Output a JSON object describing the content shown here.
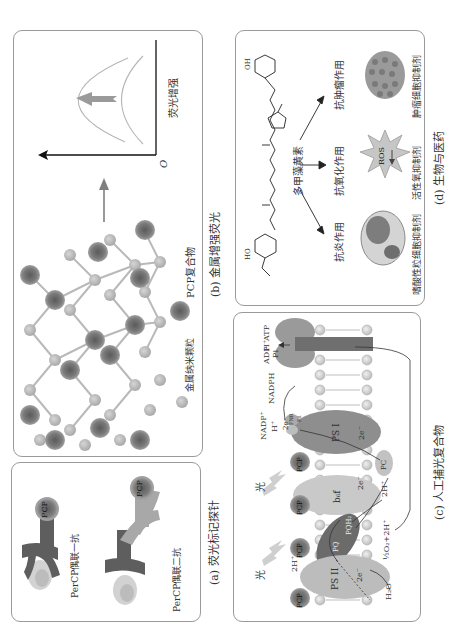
{
  "figure": {
    "panels": {
      "a": {
        "caption": "(a) 荧光标记探针",
        "labels": {
          "primary": "PerCP偶联一抗",
          "secondary": "PerCP偶联二抗",
          "pcp1": "PCP",
          "pcp2": "PCP"
        }
      },
      "b": {
        "caption": "(b) 金属增强荧光",
        "legend": {
          "pcp_complex": "PCP复合物",
          "metal_nanoparticle": "金属纳米颗粒"
        },
        "plot": {
          "ylabel": "荧光增强",
          "origin": "O"
        }
      },
      "c": {
        "caption": "(c) 人工捕光复合物",
        "labels": {
          "light1": "光",
          "light2": "光",
          "pcp": [
            "PCP",
            "PCP",
            "PCP",
            "PCP"
          ],
          "ps2": "PS II",
          "ps1": "PS I",
          "b6f": "b₆f",
          "pq": "PQ",
          "pqh2": "PQH₂",
          "pc": "PC",
          "fnr": "FNR",
          "fd": "Fd",
          "h2o": "H₂O",
          "o2": "½O₂+2H⁺",
          "2h_top": "2H⁺",
          "2h_bottom": "2H⁺",
          "2e_ps2": "2e⁻",
          "2e_b6f": "2e⁻",
          "2e_ps1": "2e⁻",
          "2e_fd": "2e⁻",
          "nadp": "NADP⁺",
          "h_nadp": "H⁺",
          "nadph": "NADPH",
          "adp": "ADP",
          "pi": "Pi",
          "h_atp": "H⁺",
          "atp": "ATP"
        }
      },
      "d": {
        "caption": "(d) 生物与医药",
        "compound": "多甲藻黄素",
        "effects": [
          "抗炎作用",
          "抗氧化作用",
          "抗肿瘤作用"
        ],
        "targets": [
          "嗜酸性粒细胞抑制剂",
          "活性氧抑制剂",
          "肿瘤细胞抑制剂"
        ],
        "ros": "ROS",
        "chem_labels": {
          "oh_top": "OH",
          "ho_bottom": "HO"
        }
      }
    },
    "colors": {
      "border": "#9a9a9a",
      "pcp_dark": "#6e6e6e",
      "pcp_ring": "#a8a8a8",
      "metal": "#b9b9b9",
      "ps_light": "#c8c8c8",
      "ps_dark": "#7d7d7d",
      "membrane_head": "#d9d9d9"
    }
  }
}
